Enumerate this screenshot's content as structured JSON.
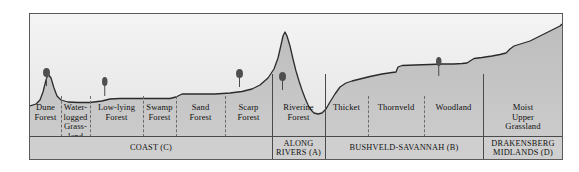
{
  "figure": {
    "colors": {
      "terrain_fill": "#b9b9b9",
      "sky_fill": "#ececec",
      "band_fill": "#cfcfcf",
      "line": "#2b2b2b",
      "tree": "#555555"
    }
  },
  "zones": [
    {
      "id": "dune-forest",
      "label": "Dune\nForest",
      "x": 30,
      "w": 31,
      "divider": "none"
    },
    {
      "id": "waterlogged-grassland",
      "label": "Water-\nlogged\nGrass-\nland",
      "x": 61,
      "w": 29,
      "divider": "dashed"
    },
    {
      "id": "low-lying-forest",
      "label": "Low-lying\nForest",
      "x": 90,
      "w": 53,
      "divider": "dashed"
    },
    {
      "id": "swamp-forest",
      "label": "Swamp\nForest",
      "x": 143,
      "w": 33,
      "divider": "dashed"
    },
    {
      "id": "sand-forest",
      "label": "Sand\nForest",
      "x": 176,
      "w": 49,
      "divider": "dashed"
    },
    {
      "id": "scarp-forest",
      "label": "Scarp\nForest",
      "x": 225,
      "w": 47,
      "divider": "dashed"
    },
    {
      "id": "riverine-forest",
      "label": "Riverine\nForest",
      "x": 272,
      "w": 53,
      "divider": "solid"
    },
    {
      "id": "thicket",
      "label": "Thicket",
      "x": 325,
      "w": 43,
      "divider": "solid"
    },
    {
      "id": "thornveld",
      "label": "Thornveld",
      "x": 368,
      "w": 56,
      "divider": "dashed"
    },
    {
      "id": "woodland",
      "label": "Woodland",
      "x": 424,
      "w": 59,
      "divider": "dashed"
    },
    {
      "id": "moist-upper-grassland",
      "label": "Moist\nUpper\nGrassland",
      "x": 483,
      "w": 80,
      "divider": "solid"
    }
  ],
  "regions": [
    {
      "id": "coast",
      "label": "COAST (C)",
      "x": 30,
      "w": 242
    },
    {
      "id": "along-rivers",
      "label": "ALONG\nRIVERS (A)",
      "x": 272,
      "w": 53
    },
    {
      "id": "bushveld-savannah",
      "label": "BUSHVELD-SAVANNAH (B)",
      "x": 325,
      "w": 158
    },
    {
      "id": "drakensberg-midlands",
      "label": "DRAKENSBERG\nMIDLANDS (D)",
      "x": 483,
      "w": 80
    }
  ],
  "trees": [
    {
      "id": "tree-dune-forest",
      "x": 46,
      "y": 67,
      "size": "large"
    },
    {
      "id": "tree-low-lying",
      "x": 105,
      "y": 76,
      "size": "small"
    },
    {
      "id": "tree-scarp-left",
      "x": 239,
      "y": 68,
      "size": "large"
    },
    {
      "id": "tree-riverine",
      "x": 282,
      "y": 71,
      "size": "large"
    },
    {
      "id": "tree-woodland",
      "x": 439,
      "y": 56,
      "size": "small"
    }
  ],
  "terrain": {
    "description": "Elevation profile rising from coastal dunes through a scarp and river valley to the Drakensberg midlands.",
    "path": "M0,92 L6,90 L10,86 L13,78 L16,66 L18,60 L21,64 L24,74 L27,82 L31,86 L38,88 L48,88.5 L60,88.5 L72,87 L80,85 L90,84.5 L105,84.5 L120,84.5 L132,84.5 L140,84.5 L146,83 L150,81 L152,80 L170,80 L185,80 L200,79 L212,77.5 L222,75 L230,71 L238,64 L244,55 L248,44 L251,31 L253,22 L255,18 L257,22 L260,32 L263,45 L266,57 L269,67 L272,76 L275,84 L278,91 L281,96 L284,99 L288,100 L292,99 L296,95 L300,88 L305,80 L310,73 L316,69 L322,67 L330,65 L340,62.5 L352,60 L362,58.5 L366,58 L368,53 L372,51.5 L385,51 L400,50.5 L412,50 L424,50 L432,49.5 L437,49 L440,47 L444,44.5 L452,43.5 L462,42 L470,40.5 L476,39 L480,35 L484,32 L492,29.5 L500,27 L508,23 L516,19 L524,15 L530,12 L532,10 L532,123 L0,123 Z",
    "outline": "M0,92 L6,90 L10,86 L13,78 L16,66 L18,60 L21,64 L24,74 L27,82 L31,86 L38,88 L48,88.5 L60,88.5 L72,87 L80,85 L90,84.5 L105,84.5 L120,84.5 L132,84.5 L140,84.5 L146,83 L150,81 L152,80 L170,80 L185,80 L200,79 L212,77.5 L222,75 L230,71 L238,64 L244,55 L248,44 L251,31 L253,22 L255,18 L257,22 L260,32 L263,45 L266,57 L269,67 L272,76 L275,84 L278,91 L281,96 L284,99 L288,100 L292,99 L296,95 L300,88 L305,80 L310,73 L316,69 L322,67 L330,65 L340,62.5 L352,60 L362,58.5 L366,58 L368,53 L372,51.5 L385,51 L400,50.5 L412,50 L424,50 L432,49.5 L437,49 L440,47 L444,44.5 L452,43.5 L462,42 L470,40.5 L476,39 L480,35 L484,32 L492,29.5 L500,27 L508,23 L516,19 L524,15 L530,12 L532,10"
  }
}
